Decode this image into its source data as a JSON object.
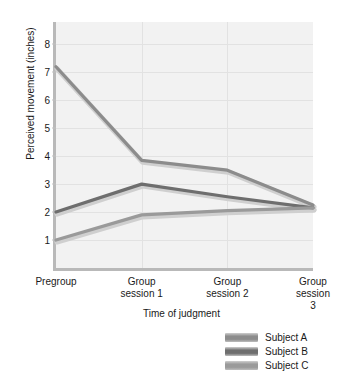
{
  "chart_data": {
    "type": "line",
    "title": "",
    "xlabel": "Time of judgment",
    "ylabel": "Perceived movement (inches)",
    "categories": [
      "Pregroup",
      "Group\nsession 1",
      "Group\nsession 2",
      "Group\nsession 3"
    ],
    "xtick_labels": [
      "Pregroup",
      "Group\nsession 1",
      "Group\nsession 2",
      "Group\nsession 3"
    ],
    "ytick_labels": [
      "8",
      "7",
      "6",
      "5",
      "4",
      "3",
      "2",
      "1"
    ],
    "ytick_values": [
      8,
      7,
      6,
      5,
      4,
      3,
      2,
      1
    ],
    "ylim": [
      0,
      8.8
    ],
    "grid": true,
    "legend_position": "below-right",
    "series": [
      {
        "name": "Subject A",
        "color": "#8c8c8c",
        "values": [
          7.2,
          3.85,
          3.5,
          2.25
        ]
      },
      {
        "name": "Subject B",
        "color": "#6e6e6e",
        "values": [
          2.0,
          3.0,
          2.55,
          2.15
        ]
      },
      {
        "name": "Subject C",
        "color": "#9a9a9a",
        "values": [
          1.0,
          1.9,
          2.05,
          2.15
        ]
      }
    ]
  },
  "legend": {
    "items": [
      {
        "label": "Subject A",
        "color": "#8c8c8c"
      },
      {
        "label": "Subject B",
        "color": "#6e6e6e"
      },
      {
        "label": "Subject C",
        "color": "#9a9a9a"
      }
    ]
  },
  "colors": {
    "plot_background": "#f2f2f2",
    "axis": "#b9b9b9",
    "gridline": "#e2e2e2",
    "text": "#1a1a1a"
  }
}
